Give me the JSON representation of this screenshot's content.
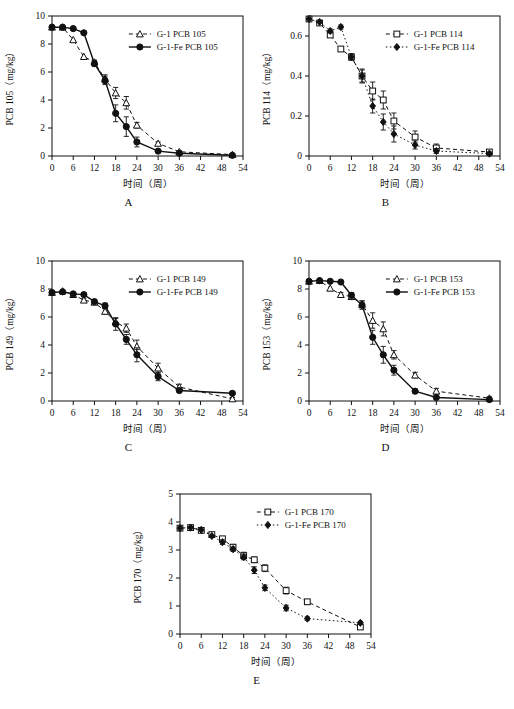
{
  "figure": {
    "xlabel": "时间（周）",
    "xticks": [
      0,
      6,
      12,
      18,
      24,
      30,
      36,
      42,
      48,
      54
    ],
    "xlim": [
      0,
      54
    ],
    "panel_letters": [
      "A",
      "B",
      "C",
      "D",
      "E"
    ]
  },
  "chart_data": [
    {
      "type": "line",
      "panel": "A",
      "title": "",
      "xlabel": "时间（周）",
      "ylabel": "PCB 105（mg/kg）",
      "xlim": [
        0,
        54
      ],
      "ylim": [
        0,
        10
      ],
      "xticks": [
        0,
        6,
        12,
        18,
        24,
        30,
        36,
        42,
        48,
        54
      ],
      "yticks": [
        0,
        2,
        4,
        6,
        8,
        10
      ],
      "grid": false,
      "legend_position": "top-right",
      "series": [
        {
          "name": "G-1 PCB 105",
          "marker": "open-triangle",
          "line": "dashed",
          "x": [
            0,
            3,
            6,
            9,
            12,
            15,
            18,
            21,
            24,
            30,
            36,
            51
          ],
          "values": [
            9.2,
            9.2,
            8.3,
            7.1,
            6.7,
            5.5,
            4.5,
            3.8,
            2.2,
            0.9,
            0.3,
            0.1
          ],
          "errors": [
            0,
            0,
            0,
            0,
            0.15,
            0.3,
            0.4,
            0.45,
            0.2,
            0.1,
            0.05,
            0.05
          ]
        },
        {
          "name": "G-1-Fe PCB 105",
          "marker": "filled-circle",
          "line": "solid",
          "x": [
            0,
            3,
            6,
            9,
            12,
            15,
            18,
            21,
            24,
            30,
            36,
            51
          ],
          "values": [
            9.2,
            9.2,
            9.1,
            8.8,
            6.6,
            5.4,
            3.05,
            2.1,
            1.0,
            0.35,
            0.2,
            0.05
          ],
          "errors": [
            0,
            0,
            0,
            0,
            0.2,
            0.3,
            0.6,
            0.7,
            0.35,
            0.1,
            0.05,
            0.03
          ]
        }
      ]
    },
    {
      "type": "line",
      "panel": "B",
      "title": "",
      "xlabel": "时间（周）",
      "ylabel": "PCB 114（mg/kg）",
      "xlim": [
        0,
        54
      ],
      "ylim": [
        0,
        0.7
      ],
      "xticks": [
        0,
        6,
        12,
        18,
        24,
        30,
        36,
        42,
        48,
        54
      ],
      "yticks": [
        0.0,
        0.2,
        0.4,
        0.6
      ],
      "grid": false,
      "legend_position": "top-right",
      "series": [
        {
          "name": "G-1 PCB 114",
          "marker": "open-square",
          "line": "dashed",
          "x": [
            0,
            3,
            6,
            9,
            12,
            15,
            18,
            21,
            24,
            30,
            36,
            51
          ],
          "values": [
            0.685,
            0.665,
            0.605,
            0.535,
            0.495,
            0.4,
            0.325,
            0.28,
            0.175,
            0.095,
            0.04,
            0.02
          ],
          "errors": [
            0,
            0,
            0.01,
            0.01,
            0.015,
            0.035,
            0.045,
            0.045,
            0.04,
            0.03,
            0.02,
            0.01
          ]
        },
        {
          "name": "G-1-Fe PCB 114",
          "marker": "filled-diamond",
          "line": "dotted",
          "x": [
            0,
            3,
            6,
            9,
            12,
            15,
            18,
            21,
            24,
            30,
            36,
            51
          ],
          "values": [
            0.685,
            0.67,
            0.625,
            0.645,
            0.495,
            0.4,
            0.25,
            0.17,
            0.11,
            0.055,
            0.025,
            0.012
          ],
          "errors": [
            0,
            0,
            0.01,
            0.01,
            0.015,
            0.03,
            0.035,
            0.04,
            0.04,
            0.02,
            0.012,
            0.008
          ]
        }
      ]
    },
    {
      "type": "line",
      "panel": "C",
      "title": "",
      "xlabel": "时间（周）",
      "ylabel": "PCB 149（mg/kg）",
      "xlim": [
        0,
        54
      ],
      "ylim": [
        0,
        10
      ],
      "xticks": [
        0,
        6,
        12,
        18,
        24,
        30,
        36,
        42,
        48,
        54
      ],
      "yticks": [
        0,
        2,
        4,
        6,
        8,
        10
      ],
      "grid": false,
      "legend_position": "top-right",
      "series": [
        {
          "name": "G-1 PCB 149",
          "marker": "open-triangle",
          "line": "dashed",
          "x": [
            0,
            3,
            6,
            9,
            12,
            15,
            18,
            21,
            24,
            30,
            36,
            51
          ],
          "values": [
            7.75,
            7.85,
            7.6,
            7.2,
            7.05,
            6.4,
            5.65,
            5.2,
            3.9,
            2.35,
            1.0,
            0.15
          ],
          "errors": [
            0,
            0,
            0,
            0.1,
            0.15,
            0.2,
            0.25,
            0.3,
            0.45,
            0.35,
            0.2,
            0.1
          ]
        },
        {
          "name": "G-1-Fe PCB 149",
          "marker": "filled-circle",
          "line": "solid",
          "x": [
            0,
            3,
            6,
            9,
            12,
            15,
            18,
            21,
            24,
            30,
            36,
            51
          ],
          "values": [
            7.75,
            7.8,
            7.65,
            7.6,
            7.1,
            6.8,
            5.5,
            4.4,
            3.3,
            1.75,
            0.75,
            0.55
          ],
          "errors": [
            0,
            0,
            0,
            0.1,
            0.15,
            0.2,
            0.45,
            0.35,
            0.5,
            0.3,
            0.15,
            0.1
          ]
        }
      ]
    },
    {
      "type": "line",
      "panel": "D",
      "title": "",
      "xlabel": "时间（周）",
      "ylabel": "PCB 153（mg/kg）",
      "xlim": [
        0,
        54
      ],
      "ylim": [
        0,
        10
      ],
      "xticks": [
        0,
        6,
        12,
        18,
        24,
        30,
        36,
        42,
        48,
        54
      ],
      "yticks": [
        0,
        2,
        4,
        6,
        8,
        10
      ],
      "grid": false,
      "legend_position": "top-right",
      "series": [
        {
          "name": "G-1 PCB 153",
          "marker": "open-triangle",
          "line": "dashed",
          "x": [
            0,
            3,
            6,
            9,
            12,
            15,
            18,
            21,
            24,
            30,
            36,
            51
          ],
          "values": [
            8.55,
            8.6,
            8.05,
            7.6,
            7.45,
            6.9,
            5.75,
            5.15,
            3.3,
            1.85,
            0.7,
            0.2
          ],
          "errors": [
            0,
            0,
            0,
            0.15,
            0.2,
            0.25,
            0.55,
            0.5,
            0.3,
            0.2,
            0.2,
            0.1
          ]
        },
        {
          "name": "G-1-Fe PCB 153",
          "marker": "filled-circle",
          "line": "solid",
          "x": [
            0,
            3,
            6,
            9,
            12,
            15,
            18,
            21,
            24,
            30,
            36,
            51
          ],
          "values": [
            8.55,
            8.6,
            8.55,
            8.5,
            7.55,
            6.85,
            4.55,
            3.3,
            2.2,
            0.7,
            0.25,
            0.1
          ],
          "errors": [
            0,
            0,
            0,
            0,
            0.2,
            0.3,
            0.5,
            0.6,
            0.35,
            0.15,
            0.1,
            0.05
          ]
        }
      ]
    },
    {
      "type": "line",
      "panel": "E",
      "title": "",
      "xlabel": "时间（周）",
      "ylabel": "PCB 170（mg/kg）",
      "xlim": [
        0,
        54
      ],
      "ylim": [
        0,
        5
      ],
      "xticks": [
        0,
        6,
        12,
        18,
        24,
        30,
        36,
        42,
        48,
        54
      ],
      "yticks": [
        0,
        1,
        2,
        3,
        4,
        5
      ],
      "grid": false,
      "legend_position": "top-right",
      "series": [
        {
          "name": "G-1 PCB 170",
          "marker": "open-square",
          "line": "dashed",
          "x": [
            0,
            3,
            6,
            9,
            12,
            15,
            18,
            21,
            24,
            30,
            36,
            51
          ],
          "values": [
            3.78,
            3.8,
            3.7,
            3.55,
            3.4,
            3.1,
            2.8,
            2.65,
            2.35,
            1.55,
            1.15,
            0.25
          ],
          "errors": [
            0,
            0,
            0,
            0,
            0.08,
            0.1,
            0.12,
            0.1,
            0.12,
            0.12,
            0.08,
            0.05
          ]
        },
        {
          "name": "G-1-Fe PCB 170",
          "marker": "filled-diamond",
          "line": "dotted",
          "x": [
            0,
            3,
            6,
            9,
            12,
            15,
            18,
            21,
            24,
            30,
            36,
            51
          ],
          "values": [
            3.78,
            3.8,
            3.72,
            3.5,
            3.28,
            3.03,
            2.75,
            2.28,
            1.65,
            0.93,
            0.55,
            0.4
          ],
          "errors": [
            0,
            0,
            0,
            0,
            0.08,
            0.08,
            0.1,
            0.12,
            0.1,
            0.1,
            0.06,
            0.05
          ]
        }
      ]
    }
  ]
}
